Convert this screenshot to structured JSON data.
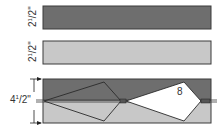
{
  "diagram": {
    "strips": [
      {
        "label_whole": "2",
        "label_frac_num": "1",
        "label_frac_den": "2\"",
        "fill": "#6e6e6e"
      },
      {
        "label_whole": "2",
        "label_frac_num": "1",
        "label_frac_den": "2\"",
        "fill": "#c8c8c8"
      }
    ],
    "sewn_unit": {
      "label_whole": "4",
      "label_frac_num": "1",
      "label_frac_den": "2\"",
      "top_fill": "#6e6e6e",
      "bottom_fill": "#c8c8c8",
      "shape_number": "8"
    },
    "colors": {
      "outline": "#3a3a3a",
      "kite": "#ffffff"
    }
  }
}
